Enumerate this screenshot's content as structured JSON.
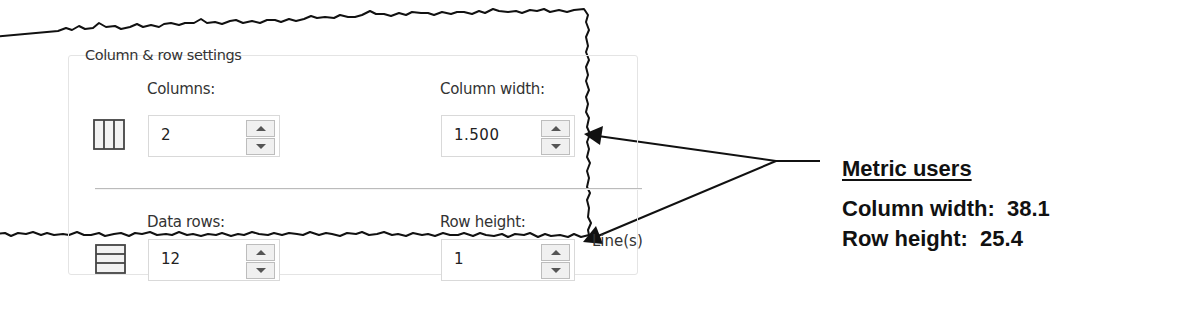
{
  "dialog": {
    "group_title": "Column & row settings",
    "columns": {
      "label": "Columns:",
      "value": "2",
      "icon": "columns-icon"
    },
    "column_width": {
      "label": "Column width:",
      "value": "1.500"
    },
    "data_rows": {
      "label": "Data rows:",
      "value": "12",
      "icon": "rows-icon"
    },
    "row_height": {
      "label": "Row height:",
      "value": "1",
      "unit": "Line(s)"
    }
  },
  "callout": {
    "title": "Metric users",
    "lines": [
      {
        "label": "Column width:",
        "value": "38.1",
        "text": "Column width:  38.1"
      },
      {
        "label": "Row height:",
        "value": "25.4",
        "text": "Row height:  25.4"
      }
    ]
  },
  "colors": {
    "frame": "#111111",
    "text": "#333333",
    "arrow": "#111111"
  }
}
